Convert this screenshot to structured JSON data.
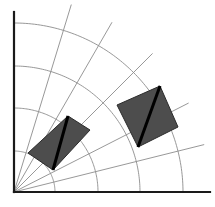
{
  "figure": {
    "width": 215,
    "height": 207,
    "background_color": "#ffffff"
  },
  "chart_data": {
    "type": "scatter",
    "title": "",
    "subtitle": "",
    "xlabel": "",
    "ylabel": "",
    "grid": true,
    "legend": false,
    "legend_position": "none",
    "coordinate_system": "polar-quadrant",
    "origin": {
      "x": 14,
      "y": 192
    },
    "axes": {
      "x_axis": {
        "from": [
          14,
          192
        ],
        "to": [
          210,
          192
        ],
        "color": "#1a1a1a",
        "width": 2.2
      },
      "y_axis": {
        "from": [
          14,
          192
        ],
        "to": [
          14,
          12
        ],
        "color": "#1a1a1a",
        "width": 2.2
      },
      "xlim": [
        0,
        196
      ],
      "ylim": [
        0,
        180
      ]
    },
    "grid_style": {
      "color": "#8c8c8c",
      "width": 0.9
    },
    "radial_arcs": [
      {
        "label": "r1",
        "radius": 41
      },
      {
        "label": "r2",
        "radius": 84
      },
      {
        "label": "r3",
        "radius": 126
      },
      {
        "label": "r4",
        "radius": 169
      }
    ],
    "angular_rays": [
      {
        "label": "a1",
        "angle_deg": 14,
        "length": 196
      },
      {
        "label": "a2",
        "angle_deg": 27,
        "length": 196
      },
      {
        "label": "a3",
        "angle_deg": 45,
        "length": 196
      },
      {
        "label": "a4",
        "angle_deg": 60,
        "length": 196
      },
      {
        "label": "a5",
        "angle_deg": 73,
        "length": 196
      }
    ],
    "shapes": [
      {
        "name": "left-quadrilateral",
        "fill": "#4d4d4d",
        "stroke": "#2b2b2b",
        "points": "68,116 90,130 53,170 28,153",
        "diagonal": {
          "from": [
            68,
            116
          ],
          "to": [
            53,
            170
          ]
        },
        "diagonal_color": "#000000",
        "diagonal_width": 3
      },
      {
        "name": "right-quadrilateral",
        "fill": "#4d4d4d",
        "stroke": "#2b2b2b",
        "points": "160,86 178,127 138,147 117,105",
        "diagonal": {
          "from": [
            160,
            86
          ],
          "to": [
            138,
            147
          ]
        },
        "diagonal_color": "#000000",
        "diagonal_width": 3
      }
    ],
    "colors": {
      "shape_fill": "#4d4d4d",
      "diagonal": "#000000",
      "grid": "#8c8c8c",
      "axis": "#1a1a1a"
    },
    "annotations": []
  }
}
